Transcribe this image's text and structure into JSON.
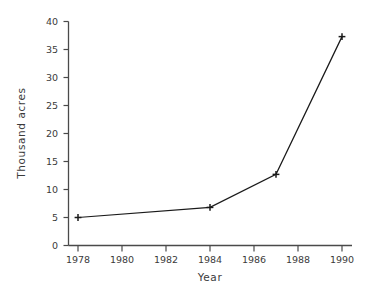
{
  "chart_data": {
    "type": "line",
    "title": "",
    "xlabel": "Year",
    "ylabel": "Thousand acres",
    "x": [
      1978,
      1984,
      1987,
      1990
    ],
    "values": [
      5.0,
      6.8,
      12.7,
      37.3
    ],
    "series": [
      {
        "name": "Acres",
        "x": [
          1978,
          1984,
          1987,
          1990
        ],
        "values": [
          5.0,
          6.8,
          12.7,
          37.3
        ]
      }
    ],
    "xlim": [
      1977,
      1991
    ],
    "ylim": [
      0,
      40
    ],
    "xticks": [
      1978,
      1980,
      1982,
      1984,
      1986,
      1988,
      1990
    ],
    "xticklabels": [
      "1978",
      "1980",
      "1982",
      "1984",
      "1986",
      "1988",
      "1990"
    ],
    "yticks": [
      0,
      5,
      10,
      15,
      20,
      25,
      30,
      35,
      40
    ],
    "yticklabels": [
      "0",
      "5",
      "10",
      "15",
      "20",
      "25",
      "30",
      "35",
      "40"
    ],
    "grid": false,
    "legend": false,
    "marker": "plus",
    "line_color": "#1a1a1a",
    "marker_color": "#1a1a1a",
    "axis_color": "#4a4a4a",
    "background": "#ffffff"
  },
  "axes": {
    "x_title": "Year",
    "y_title": "Thousand acres"
  }
}
